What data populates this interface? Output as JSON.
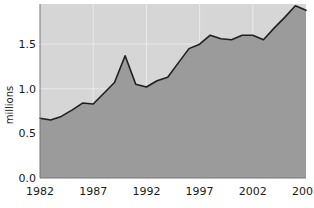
{
  "chart_data": {
    "type": "area",
    "title": "",
    "subtitle": "",
    "xlabel": "",
    "ylabel": "millions",
    "xlim": [
      1982,
      2007
    ],
    "ylim": [
      0.0,
      1.95
    ],
    "grid": true,
    "legend": null,
    "x_ticks": [
      "1982",
      "1987",
      "1992",
      "1997",
      "2002",
      "2007"
    ],
    "x_tick_values": [
      1982,
      1987,
      1992,
      1997,
      2002,
      2007
    ],
    "y_ticks": [
      "0.0",
      "0.5",
      "1.0",
      "1.5"
    ],
    "y_tick_values": [
      0.0,
      0.5,
      1.0,
      1.5
    ],
    "x": [
      1982,
      1983,
      1984,
      1985,
      1986,
      1987,
      1988,
      1989,
      1990,
      1991,
      1992,
      1993,
      1994,
      1995,
      1996,
      1997,
      1998,
      1999,
      2000,
      2001,
      2002,
      2003,
      2004,
      2005,
      2006,
      2007
    ],
    "values": [
      0.67,
      0.65,
      0.69,
      0.76,
      0.84,
      0.83,
      0.95,
      1.07,
      1.37,
      1.05,
      1.02,
      1.09,
      1.13,
      1.29,
      1.45,
      1.5,
      1.6,
      1.56,
      1.55,
      1.6,
      1.6,
      1.55,
      1.68,
      1.8,
      1.93,
      1.88
    ],
    "series": [
      {
        "name": "millions",
        "values": [
          0.67,
          0.65,
          0.69,
          0.76,
          0.84,
          0.83,
          0.95,
          1.07,
          1.37,
          1.05,
          1.02,
          1.09,
          1.13,
          1.29,
          1.45,
          1.5,
          1.6,
          1.56,
          1.55,
          1.6,
          1.6,
          1.55,
          1.68,
          1.8,
          1.93,
          1.88
        ]
      }
    ],
    "colors": {
      "plot_background": "#d6d6d6",
      "area_fill": "#9b9b9b",
      "line": "#1f1f1f",
      "gridline": "#eaeaea",
      "page_background": "#ffffff",
      "text": "#1a1a1a"
    }
  }
}
